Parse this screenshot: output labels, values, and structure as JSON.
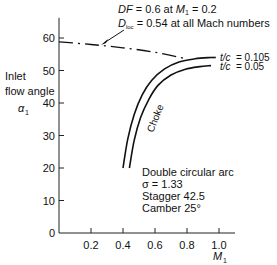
{
  "chart_data": {
    "type": "line",
    "title": "",
    "xlabel": "M",
    "xlabel_sub": "1",
    "ylabel_lines": [
      "Inlet",
      "flow angle"
    ],
    "ylabel_symbol": "α",
    "ylabel_symbol_sub": "1",
    "xlim": [
      0,
      1.1
    ],
    "ylim": [
      0,
      65
    ],
    "x_ticks": [
      0.2,
      0.4,
      0.6,
      0.8,
      1.0
    ],
    "x_tick_labels": [
      "0.2",
      "0.4",
      "0.6",
      "0.8",
      "1.0"
    ],
    "y_ticks": [
      0,
      10,
      20,
      30,
      40,
      50,
      60
    ],
    "y_tick_labels": [
      "0",
      "10",
      "20",
      "30",
      "40",
      "50",
      "60"
    ],
    "grid": false,
    "series": [
      {
        "name": "DF = 0.6 limit",
        "style": "dash-dot",
        "x": [
          0.0,
          0.2,
          0.4,
          0.6,
          0.78
        ],
        "y": [
          58.8,
          58.0,
          57.0,
          55.6,
          53.8
        ]
      },
      {
        "name": "t/c = 0.105",
        "style": "solid",
        "x": [
          0.4,
          0.43,
          0.47,
          0.52,
          0.58,
          0.66,
          0.75,
          0.85,
          0.95
        ],
        "y": [
          20.0,
          29.0,
          36.5,
          42.5,
          47.0,
          50.5,
          52.6,
          53.6,
          54.0
        ]
      },
      {
        "name": "t/c = 0.05",
        "style": "solid",
        "x": [
          0.44,
          0.47,
          0.51,
          0.56,
          0.62,
          0.7,
          0.79,
          0.88,
          0.95
        ],
        "y": [
          20.0,
          28.5,
          35.5,
          41.0,
          45.5,
          48.6,
          50.4,
          51.2,
          51.5
        ]
      }
    ],
    "curve_labels": [
      {
        "series": "t/c = 0.105",
        "prefix": "t/c",
        "value": "= 0.105"
      },
      {
        "series": "t/c = 0.05",
        "prefix": "t/c",
        "value": "= 0.05"
      }
    ],
    "annotations": {
      "df_line": {
        "sym": "DF",
        "text": " = 0.6 at ",
        "m": "M",
        "m_sub": "1",
        "tail": " = 0.2"
      },
      "dloc_line": {
        "sym": "D",
        "sym_sub": "loc",
        "text": " = 0.54 at all Mach numbers"
      },
      "choke": "Choke",
      "blade_info": [
        "Double circular arc",
        "σ = 1.33",
        "Stagger 42.5",
        "Camber 25°"
      ]
    }
  }
}
